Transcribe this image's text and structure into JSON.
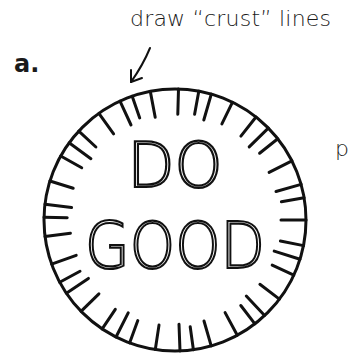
{
  "step_label": "a.",
  "caption": "draw “crust” lines",
  "side_letter": "p",
  "coin": {
    "line1": "DO",
    "line2": "GOOD",
    "crust_line_count": 40,
    "stroke_color": "#111111"
  },
  "arrow": {
    "direction": "down-left"
  }
}
